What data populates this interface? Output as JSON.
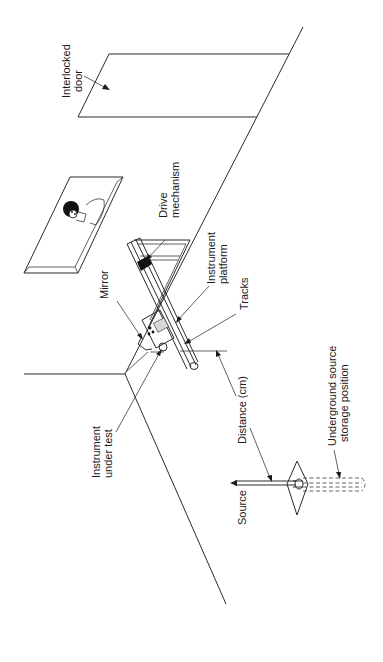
{
  "figure": {
    "orientation": "rotated-90-ccw"
  },
  "labels": {
    "interlocked_door": [
      "Interlocked",
      "door"
    ],
    "drive_mechanism": [
      "Drive",
      "mechanism"
    ],
    "instrument_platform": [
      "Instrument",
      "platform"
    ],
    "mirror": "Mirror",
    "tracks": "Tracks",
    "instrument_under_test": [
      "Instrument",
      "under test"
    ],
    "distance": "Distance (cm)",
    "source": "Source",
    "underground_storage": [
      "Underground source",
      "storage position"
    ]
  },
  "colors": {
    "line": "#2a2a2a",
    "fill_dark": "#111111",
    "background": "#ffffff"
  }
}
